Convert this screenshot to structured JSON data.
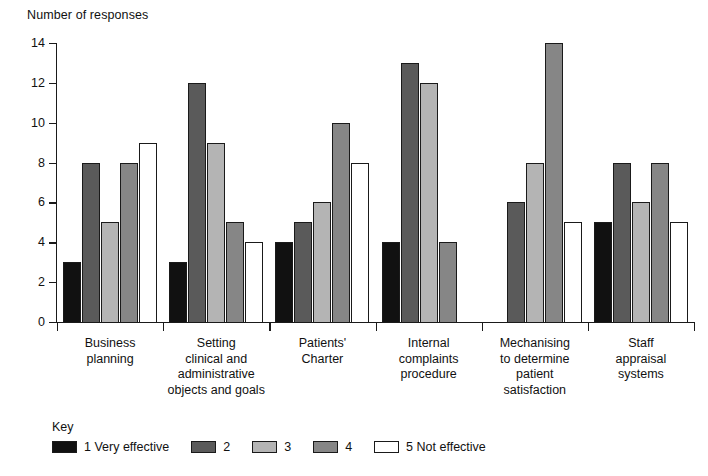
{
  "chart_data": {
    "type": "bar",
    "title": "",
    "ylabel": "Number of responses",
    "xlabel": "",
    "ylim": [
      0,
      14
    ],
    "yticks": [
      0,
      2,
      4,
      6,
      8,
      10,
      12,
      14
    ],
    "grid": false,
    "legend_position": "bottom-left",
    "legend_title": "Key",
    "categories": [
      "Business planning",
      "Setting clinical and administrative objects and goals",
      "Patients' Charter",
      "Internal complaints procedure",
      "Mechanising to determine patient satisfaction",
      "Staff appraisal systems"
    ],
    "category_lines": [
      [
        "Business",
        "planning"
      ],
      [
        "Setting",
        "clinical and",
        "administrative",
        "objects and goals"
      ],
      [
        "Patients'",
        "Charter"
      ],
      [
        "Internal",
        "complaints",
        "procedure"
      ],
      [
        "Mechanising",
        "to determine",
        "patient",
        "satisfaction"
      ],
      [
        "Staff",
        "appraisal",
        "systems"
      ]
    ],
    "series": [
      {
        "name": "1 Very effective",
        "short": "1",
        "color": "#111111",
        "values": [
          3,
          3,
          4,
          4,
          0,
          5
        ]
      },
      {
        "name": "2",
        "short": "2",
        "color": "#5a5a5a",
        "values": [
          8,
          12,
          5,
          13,
          6,
          8
        ]
      },
      {
        "name": "3",
        "short": "3",
        "color": "#b4b4b4",
        "values": [
          5,
          9,
          6,
          12,
          8,
          6
        ]
      },
      {
        "name": "4",
        "short": "4",
        "color": "#868686",
        "values": [
          8,
          5,
          10,
          4,
          14,
          8
        ]
      },
      {
        "name": "5 Not effective",
        "short": "5",
        "color": "#ffffff",
        "values": [
          9,
          4,
          8,
          0,
          5,
          5
        ]
      }
    ]
  },
  "legend": {
    "title": "Key",
    "items": [
      {
        "label": "1 Very effective",
        "color": "#111111"
      },
      {
        "label": "2",
        "color": "#5a5a5a"
      },
      {
        "label": "3",
        "color": "#b4b4b4"
      },
      {
        "label": "4",
        "color": "#868686"
      },
      {
        "label": "5 Not effective",
        "color": "#ffffff"
      }
    ]
  },
  "axis": {
    "y_title": "Number of responses"
  }
}
